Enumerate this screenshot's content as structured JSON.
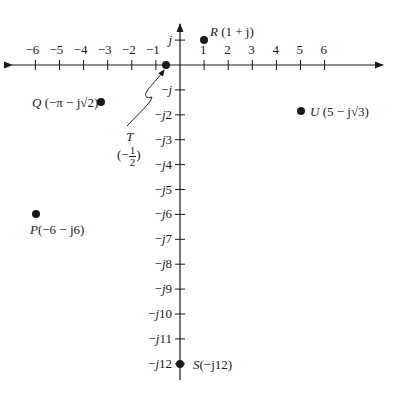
{
  "diagram": {
    "type": "complex-plane",
    "x_ticks": [
      "−6",
      "−5",
      "−4",
      "−3",
      "−2",
      "−1",
      "1",
      "2",
      "3",
      "4",
      "5",
      "6"
    ],
    "y_ticks_pos": [
      "j"
    ],
    "y_ticks_neg": [
      "−j",
      "−j2",
      "−j3",
      "−j4",
      "−j5",
      "−j6",
      "−j7",
      "−j8",
      "−j9",
      "−j10",
      "−j11",
      "−j12"
    ],
    "points": [
      {
        "id": "R",
        "name": "R",
        "coords": "(1 + j)",
        "re": 1,
        "im": 1
      },
      {
        "id": "Q",
        "name": "Q",
        "coords": "(−π − j√2)",
        "re": -3.14159,
        "im": -1.41421
      },
      {
        "id": "T",
        "name": "T",
        "coords_open": "(−",
        "frac_num": "1",
        "frac_den": "2",
        "coords_close": ")",
        "re": -0.5,
        "im": 0
      },
      {
        "id": "U",
        "name": "U",
        "coords": "(5 − j√3)",
        "re": 5,
        "im": -1.73205
      },
      {
        "id": "P",
        "name": "P",
        "coords": "(−6 − j6)",
        "re": -6,
        "im": -6
      },
      {
        "id": "S",
        "name": "S",
        "coords": "(−j12)",
        "re": 0,
        "im": -12
      }
    ],
    "colors": {
      "ink": "#1a1a1a",
      "background": "#ffffff"
    }
  }
}
